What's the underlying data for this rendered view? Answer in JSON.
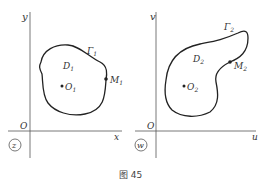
{
  "figure": {
    "caption": "图 45",
    "left_plane": {
      "badge": "z",
      "origin": "O",
      "x_axis": "x",
      "y_axis": "y",
      "region": "D",
      "region_sub": "1",
      "curve": "Γ",
      "curve_sub": "1",
      "center_point": "O",
      "center_sub": "1",
      "boundary_point": "M",
      "boundary_sub": "1"
    },
    "right_plane": {
      "badge": "w",
      "origin": "O",
      "x_axis": "u",
      "y_axis": "v",
      "region": "D",
      "region_sub": "2",
      "curve": "Γ",
      "curve_sub": "2",
      "center_point": "O",
      "center_sub": "2",
      "boundary_point": "M",
      "boundary_sub": "2"
    }
  }
}
